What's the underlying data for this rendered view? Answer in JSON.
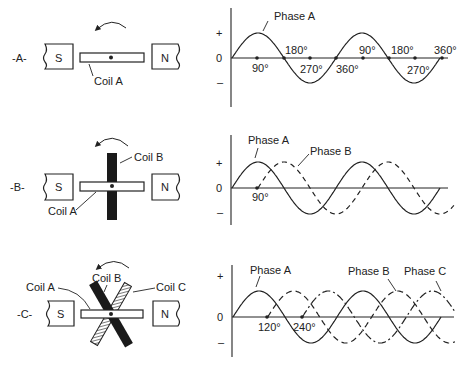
{
  "panels": [
    {
      "id": "A",
      "label": "-A-",
      "magnets": {
        "south": "S",
        "north": "N"
      },
      "coils": [
        {
          "name": "Coil A",
          "style": "outline",
          "angle": 0
        }
      ],
      "rotation_arrow": "counterclockwise"
    },
    {
      "id": "B",
      "label": "-B-",
      "magnets": {
        "south": "S",
        "north": "N"
      },
      "coils": [
        {
          "name": "Coil A",
          "style": "outline",
          "angle": 0
        },
        {
          "name": "Coil B",
          "style": "solid",
          "angle": 90
        }
      ],
      "rotation_arrow": "counterclockwise"
    },
    {
      "id": "C",
      "label": "-C-",
      "magnets": {
        "south": "S",
        "north": "N"
      },
      "coils": [
        {
          "name": "Coil A",
          "style": "outline",
          "angle": 0
        },
        {
          "name": "Coil B",
          "style": "solid",
          "angle": 120
        },
        {
          "name": "Coil C",
          "style": "hatched",
          "angle": 60
        }
      ],
      "rotation_arrow": "counterclockwise"
    }
  ],
  "axis_labels": {
    "plus": "+",
    "zero": "0",
    "minus": "–"
  },
  "chart_data": [
    {
      "type": "line",
      "title": "Single phase (Coil A)",
      "ylabel_ticks": [
        "+",
        "0",
        "–"
      ],
      "series": [
        {
          "name": "Phase A",
          "style": "solid",
          "phase_offset_deg": 0
        }
      ],
      "x_range_deg": [
        0,
        720
      ],
      "annotations": [
        {
          "text": "90°",
          "x_deg": 90,
          "position": "below"
        },
        {
          "text": "180°",
          "x_deg": 180,
          "position": "above"
        },
        {
          "text": "270°",
          "x_deg": 270,
          "position": "below"
        },
        {
          "text": "360°",
          "x_deg": 360,
          "position": "below"
        },
        {
          "text": "90°",
          "x_deg": 450,
          "position": "above"
        },
        {
          "text": "180°",
          "x_deg": 540,
          "position": "above"
        },
        {
          "text": "270°",
          "x_deg": 630,
          "position": "below"
        },
        {
          "text": "360°",
          "x_deg": 720,
          "position": "above"
        }
      ],
      "grid": false
    },
    {
      "type": "line",
      "title": "Two phase (Coils A, B)",
      "ylabel_ticks": [
        "+",
        "0",
        "–"
      ],
      "series": [
        {
          "name": "Phase A",
          "style": "solid",
          "phase_offset_deg": 0
        },
        {
          "name": "Phase B",
          "style": "dashed",
          "phase_offset_deg": 90
        }
      ],
      "x_range_deg": [
        0,
        720
      ],
      "annotations": [
        {
          "text": "90°",
          "x_deg": 90,
          "position": "below"
        }
      ],
      "grid": false
    },
    {
      "type": "line",
      "title": "Three phase (Coils A, B, C)",
      "ylabel_ticks": [
        "+",
        "0",
        "–"
      ],
      "series": [
        {
          "name": "Phase A",
          "style": "solid",
          "phase_offset_deg": 0
        },
        {
          "name": "Phase B",
          "style": "dashed",
          "phase_offset_deg": 120
        },
        {
          "name": "Phase C",
          "style": "dash-dot",
          "phase_offset_deg": 240
        }
      ],
      "x_range_deg": [
        0,
        720
      ],
      "annotations": [
        {
          "text": "120°",
          "x_deg": 120,
          "position": "below"
        },
        {
          "text": "240°",
          "x_deg": 240,
          "position": "below"
        }
      ],
      "grid": false
    }
  ]
}
